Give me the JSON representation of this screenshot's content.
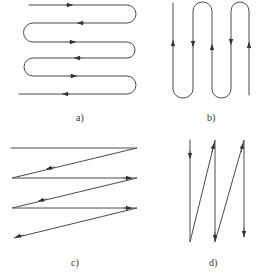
{
  "figure": {
    "panels": [
      {
        "id": "a",
        "label": "a)",
        "description": "horizontal serpentine path with rounded turns and direction arrows"
      },
      {
        "id": "b",
        "label": "b)",
        "description": "vertical serpentine path with rounded turns and direction arrows"
      },
      {
        "id": "c",
        "label": "c)",
        "description": "horizontal zigzag path with diagonal returns and direction arrows"
      },
      {
        "id": "d",
        "label": "d)",
        "description": "vertical zigzag path with diagonal returns and direction arrows"
      }
    ],
    "colors": {
      "stroke": "#4a4a4a",
      "text": "#333333",
      "background": "#ffffff"
    }
  }
}
